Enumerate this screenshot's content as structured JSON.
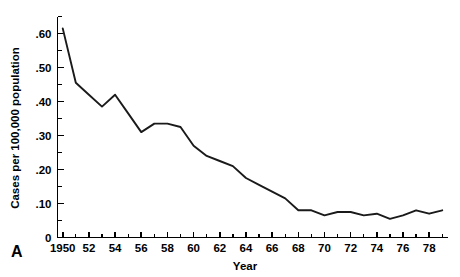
{
  "panel": {
    "label": "A"
  },
  "chart_data": {
    "type": "line",
    "title": "",
    "subtitle": "",
    "xlabel": "Year",
    "ylabel": "Cases per 100,000 population",
    "xlim": [
      1949.6,
      1979.4
    ],
    "ylim": [
      0,
      0.65
    ],
    "grid": false,
    "legend": null,
    "line_color": "#1a1a1a",
    "background_color": "#ffffff",
    "x": [
      1950,
      1951,
      1952,
      1953,
      1954,
      1955,
      1956,
      1957,
      1958,
      1959,
      1960,
      1961,
      1962,
      1963,
      1964,
      1965,
      1966,
      1967,
      1968,
      1969,
      1970,
      1971,
      1972,
      1973,
      1974,
      1975,
      1976,
      1977,
      1978,
      1979
    ],
    "values": [
      0.615,
      0.455,
      0.42,
      0.385,
      0.42,
      0.365,
      0.31,
      0.335,
      0.335,
      0.325,
      0.27,
      0.24,
      0.225,
      0.21,
      0.175,
      0.155,
      0.135,
      0.115,
      0.08,
      0.08,
      0.065,
      0.075,
      0.075,
      0.065,
      0.07,
      0.055,
      0.065,
      0.08,
      0.07,
      0.08
    ],
    "x_ticks": [
      1950,
      1952,
      1954,
      1956,
      1958,
      1960,
      1962,
      1964,
      1966,
      1968,
      1970,
      1972,
      1974,
      1976,
      1978
    ],
    "x_tick_labels": [
      "1950",
      "52",
      "54",
      "56",
      "58",
      "60",
      "62",
      "64",
      "66",
      "68",
      "70",
      "72",
      "74",
      "76",
      "78"
    ],
    "x_minor_ticks": [
      1951,
      1953,
      1955,
      1957,
      1959,
      1961,
      1963,
      1965,
      1967,
      1969,
      1971,
      1973,
      1975,
      1977,
      1979
    ],
    "y_ticks": [
      0,
      0.1,
      0.2,
      0.3,
      0.4,
      0.5,
      0.6
    ],
    "y_tick_labels": [
      "0",
      ".10",
      ".20",
      ".30",
      ".40",
      ".50",
      ".60"
    ],
    "y_minor_ticks": [
      0.05,
      0.15,
      0.25,
      0.35,
      0.45,
      0.55,
      0.65
    ]
  }
}
